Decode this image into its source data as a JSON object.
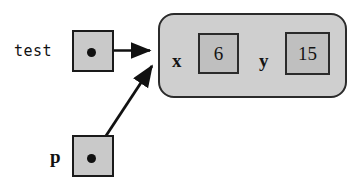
{
  "diagram": {
    "background_color": "#ffffff",
    "ink_color": "#111111",
    "cell_fill_color": "#c9c9c9",
    "object_fill_color": "#cfcfcf",
    "value_fill_color": "#bfbfbf"
  },
  "variables": [
    {
      "name": "test",
      "label": "test",
      "points_to": "object"
    },
    {
      "name": "p",
      "label": "p",
      "points_to": "object"
    }
  ],
  "object": {
    "name": "heap-object",
    "fields": [
      {
        "key": "x",
        "value": "6"
      },
      {
        "key": "y",
        "value": "15"
      }
    ]
  },
  "arrows": [
    {
      "name": "test-to-object",
      "from": "test",
      "to": "object",
      "style": "straight"
    },
    {
      "name": "p-to-object",
      "from": "p",
      "to": "object",
      "style": "diagonal"
    }
  ]
}
